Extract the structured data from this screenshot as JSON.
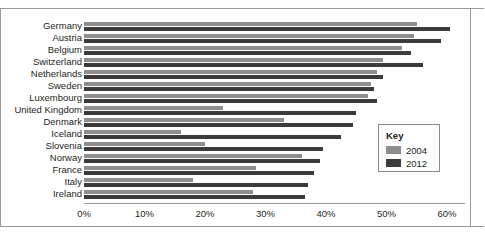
{
  "chart_data": {
    "type": "bar",
    "orientation": "horizontal",
    "title": "",
    "subtitle": "",
    "xlabel": "",
    "ylabel": "",
    "grid": false,
    "xlim": [
      0,
      63
    ],
    "xticks": [
      0,
      10,
      20,
      30,
      40,
      50,
      60
    ],
    "xtick_labels": [
      "0%",
      "10%",
      "20%",
      "30%",
      "40%",
      "50%",
      "60%"
    ],
    "categories": [
      "Germany",
      "Austria",
      "Belgium",
      "Switzerland",
      "Netherlands",
      "Sweden",
      "Luxembourg",
      "United Kingdom",
      "Denmark",
      "Iceland",
      "Slovenia",
      "Norway",
      "France",
      "Italy",
      "Ireland"
    ],
    "series": [
      {
        "name": "2004",
        "color": "#8e8e8e",
        "values": [
          55.0,
          54.5,
          52.5,
          49.5,
          48.5,
          47.5,
          47.0,
          23.0,
          33.0,
          16.0,
          20.0,
          36.0,
          28.5,
          18.0,
          28.0
        ]
      },
      {
        "name": "2012",
        "color": "#3b3b3b",
        "values": [
          60.5,
          59.0,
          54.0,
          56.0,
          49.5,
          48.0,
          48.5,
          45.0,
          44.5,
          42.5,
          39.5,
          39.0,
          38.0,
          37.0,
          36.5
        ]
      }
    ],
    "legend": {
      "title": "Key",
      "position": "right-middle",
      "entries": [
        {
          "label": "2004",
          "color": "#8e8e8e"
        },
        {
          "label": "2012",
          "color": "#3b3b3b"
        }
      ]
    }
  }
}
